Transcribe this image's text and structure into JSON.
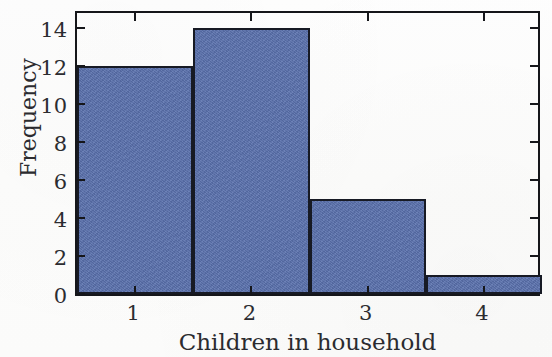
{
  "chart_data": {
    "type": "bar",
    "title": "",
    "subtitle": "",
    "xlabel": "Children in household",
    "ylabel": "Frequency",
    "categories": [
      "1",
      "2",
      "3",
      "4"
    ],
    "values": [
      12,
      14,
      5,
      1
    ],
    "series": [
      {
        "name": "Frequency",
        "values": [
          12,
          14,
          5,
          1
        ]
      }
    ],
    "ylim": [
      0,
      15
    ],
    "xlim": [
      0.5,
      4.5
    ],
    "y_ticks": [
      0,
      2,
      4,
      6,
      8,
      10,
      12,
      14
    ],
    "y_tick_labels": [
      "0",
      "2",
      "4",
      "6",
      "8",
      "10",
      "12",
      "14"
    ],
    "x_ticks": [
      1,
      2,
      3,
      4
    ],
    "x_tick_labels": [
      "1",
      "2",
      "3",
      "4"
    ],
    "grid": false,
    "legend": false,
    "legend_position": "none",
    "bar_color": "#5a71ae",
    "bar_edge_color": "#171a24",
    "axis_color": "#15161a",
    "background_color": "#fdfdfc",
    "ticks_inward_all_sides": true,
    "bar_width_fraction": 1.0
  }
}
